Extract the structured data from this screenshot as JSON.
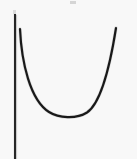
{
  "figure": {
    "title": "",
    "caption": "",
    "background_color": "#fafafa",
    "ink_color": "#1c1c1c",
    "axis": {
      "name": "vertical-axis",
      "label": "",
      "color": "#262626",
      "x": 15,
      "y_top": 14,
      "y_bottom": 159,
      "stroke_width": 2.1
    },
    "curve": {
      "name": "convex-u-curve",
      "label": "",
      "shape": "u-shaped",
      "color": "#1a1a1a",
      "stroke_width": 2.2,
      "start_point": [
        20,
        29
      ],
      "end_point": [
        116,
        28
      ],
      "vertex_point": [
        67,
        118
      ],
      "path": "M 20 29 C 21.5 62, 30 100, 49 112 C 58.5 118, 76 119.5, 87 112.5 C 101 103, 110 66, 116 28"
    },
    "artifacts": [
      {
        "name": "scan-speck-top",
        "x": 70,
        "y": 1,
        "width": 6,
        "height": 3,
        "color": "#c9c9c9"
      },
      {
        "name": "scan-speck-left",
        "x": 13,
        "y": 10,
        "width": 3,
        "height": 4,
        "color": "#d5d5d5"
      }
    ],
    "annotations": [],
    "tick_labels": [],
    "legend": []
  }
}
